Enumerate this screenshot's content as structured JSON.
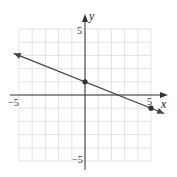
{
  "chart_data": {
    "type": "line",
    "title": "",
    "xlabel": "x",
    "ylabel": "y",
    "xlim": [
      -5,
      5
    ],
    "ylim": [
      -5,
      5
    ],
    "grid": true,
    "tick_labels": {
      "x": [
        "-5",
        "5"
      ],
      "y": [
        "5",
        "-5"
      ]
    },
    "series": [
      {
        "name": "line",
        "slope": -0.4,
        "intercept": 1,
        "arrows": "both",
        "points": [
          {
            "x": 0,
            "y": 1
          },
          {
            "x": 5,
            "y": -1
          }
        ]
      }
    ],
    "marked_points": [
      {
        "x": 0,
        "y": 1
      },
      {
        "x": 5,
        "y": -1
      }
    ]
  },
  "labels": {
    "x_axis": "x",
    "y_axis": "y",
    "x_min": "−5",
    "x_max": "5",
    "y_max": "5",
    "y_min": "−5"
  }
}
